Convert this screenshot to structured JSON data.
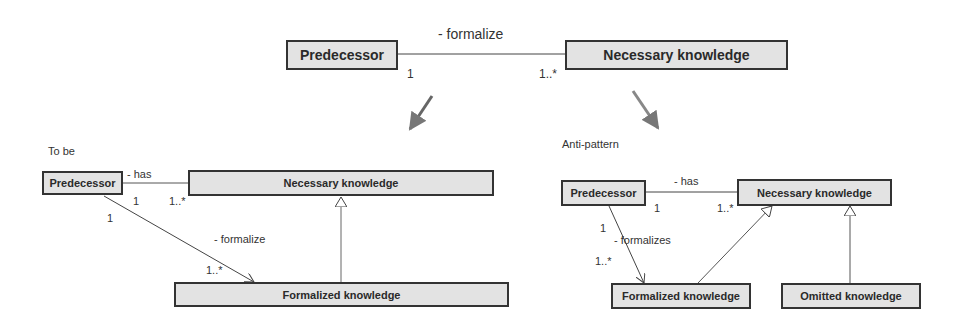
{
  "diagram": {
    "top": {
      "class_left": "Predecessor",
      "class_right": "Necessary knowledge",
      "association": "- formalize",
      "mult_left": "1",
      "mult_right": "1..*"
    },
    "to_be": {
      "title": "To be",
      "predecessor": "Predecessor",
      "necessary": "Necessary knowledge",
      "formalized": "Formalized knowledge",
      "has_label": "- has",
      "has_mult_left": "1",
      "has_mult_right": "1..*",
      "formalize_label": "- formalize",
      "formalize_mult_src": "1",
      "formalize_mult_dst": "1..*"
    },
    "anti_pattern": {
      "title": "Anti-pattern",
      "predecessor": "Predecessor",
      "necessary": "Necessary knowledge",
      "formalized": "Formalized knowledge",
      "omitted": "Omitted knowledge",
      "has_label": "- has",
      "has_mult_left": "1",
      "has_mult_right": "1..*",
      "formalize_label": "- formalizes",
      "formalize_mult_src": "1",
      "formalize_mult_dst": "1..*"
    },
    "colors": {
      "box_fill": "#e3e3e3",
      "box_border": "#333333",
      "transition_arrow": "#7a7a7a"
    }
  }
}
